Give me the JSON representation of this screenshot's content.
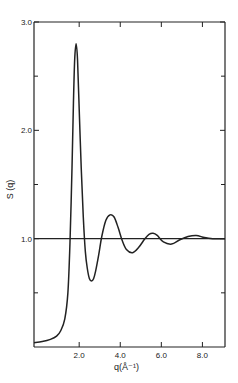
{
  "chart_data": {
    "type": "line",
    "title": "",
    "xlabel": "q(Å⁻¹)",
    "ylabel": "S (q)",
    "xlim": [
      -0.2,
      9.1
    ],
    "ylim": [
      0,
      3.0
    ],
    "x_ticks": [
      2.0,
      4.0,
      6.0,
      8.0
    ],
    "x_tick_labels": [
      "2.0",
      "4.0",
      "6.0",
      "8.0"
    ],
    "y_ticks_labeled": [
      1.0,
      2.0,
      3.0
    ],
    "y_tick_labels": [
      "1.0",
      "2.0",
      "3.0"
    ],
    "y_ticks_minor": [
      0.5,
      1.5,
      2.5
    ],
    "reference_line": {
      "y": 1.0
    },
    "grid": false,
    "series": [
      {
        "name": "S(q)",
        "x": [
          -0.2,
          0.2,
          0.6,
          0.9,
          1.1,
          1.3,
          1.45,
          1.55,
          1.65,
          1.72,
          1.78,
          1.85,
          1.92,
          2.0,
          2.1,
          2.2,
          2.3,
          2.4,
          2.5,
          2.6,
          2.7,
          2.8,
          2.95,
          3.1,
          3.3,
          3.5,
          3.7,
          3.9,
          4.1,
          4.3,
          4.6,
          4.9,
          5.2,
          5.4,
          5.6,
          5.8,
          6.1,
          6.5,
          6.9,
          7.3,
          7.7,
          8.1,
          8.5,
          9.1
        ],
        "y": [
          0.04,
          0.05,
          0.07,
          0.1,
          0.15,
          0.26,
          0.5,
          0.95,
          1.65,
          2.25,
          2.65,
          2.8,
          2.65,
          2.2,
          1.65,
          1.2,
          0.88,
          0.72,
          0.63,
          0.61,
          0.63,
          0.7,
          0.85,
          1.02,
          1.17,
          1.22,
          1.2,
          1.1,
          0.98,
          0.9,
          0.87,
          0.92,
          1.0,
          1.04,
          1.05,
          1.03,
          0.97,
          0.95,
          0.99,
          1.02,
          1.03,
          1.01,
          1.0,
          1.0
        ]
      }
    ]
  }
}
